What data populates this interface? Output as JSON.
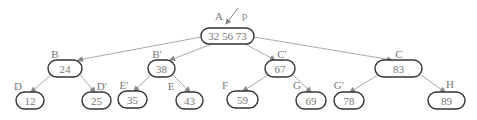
{
  "diagram": {
    "type": "tree",
    "pointer": {
      "label": "p"
    },
    "nodes": [
      {
        "id": "A",
        "label": "A",
        "keys": "32  56  73",
        "x": 201,
        "y": 28,
        "w": 53,
        "h": 16,
        "lx": 219,
        "ly": 20
      },
      {
        "id": "B",
        "label": "B",
        "keys": "24",
        "x": 48,
        "y": 60,
        "w": 34,
        "h": 17,
        "lx": 55,
        "ly": 58
      },
      {
        "id": "B1",
        "label": "B′",
        "keys": "38",
        "x": 148,
        "y": 60,
        "w": 27,
        "h": 17,
        "lx": 157,
        "ly": 58
      },
      {
        "id": "C1",
        "label": "C′",
        "keys": "67",
        "x": 265,
        "y": 60,
        "w": 30,
        "h": 17,
        "lx": 282,
        "ly": 58
      },
      {
        "id": "C",
        "label": "C",
        "keys": "83",
        "x": 375,
        "y": 60,
        "w": 47,
        "h": 17,
        "lx": 399,
        "ly": 58
      },
      {
        "id": "D",
        "label": "D",
        "keys": "12",
        "x": 16,
        "y": 92,
        "w": 28,
        "h": 17,
        "lx": 18,
        "ly": 90
      },
      {
        "id": "D1",
        "label": "D′",
        "keys": "25",
        "x": 82,
        "y": 92,
        "w": 29,
        "h": 17,
        "lx": 102,
        "ly": 90
      },
      {
        "id": "E1",
        "label": "E′",
        "keys": "35",
        "x": 118,
        "y": 91,
        "w": 29,
        "h": 17,
        "lx": 124,
        "ly": 89
      },
      {
        "id": "E",
        "label": "E",
        "keys": "43",
        "x": 176,
        "y": 92,
        "w": 27,
        "h": 17,
        "lx": 171,
        "ly": 90
      },
      {
        "id": "F",
        "label": "F",
        "keys": "59",
        "x": 227,
        "y": 91,
        "w": 31,
        "h": 17,
        "lx": 225,
        "ly": 89
      },
      {
        "id": "G",
        "label": "G",
        "keys": "69",
        "x": 296,
        "y": 92,
        "w": 30,
        "h": 17,
        "lx": 297,
        "ly": 89
      },
      {
        "id": "G1",
        "label": "G′",
        "keys": "78",
        "x": 334,
        "y": 92,
        "w": 30,
        "h": 17,
        "lx": 339,
        "ly": 89
      },
      {
        "id": "H",
        "label": "H",
        "keys": "89",
        "x": 428,
        "y": 92,
        "w": 37,
        "h": 17,
        "lx": 450,
        "ly": 88
      }
    ],
    "edges": [
      {
        "from": "A",
        "to": "B",
        "x1": 201,
        "y1": 37,
        "x2": 78,
        "y2": 60
      },
      {
        "from": "A",
        "to": "B1",
        "x1": 212,
        "y1": 44,
        "x2": 170,
        "y2": 60
      },
      {
        "from": "A",
        "to": "C1",
        "x1": 245,
        "y1": 44,
        "x2": 275,
        "y2": 60
      },
      {
        "from": "A",
        "to": "C",
        "x1": 254,
        "y1": 37,
        "x2": 392,
        "y2": 60
      },
      {
        "from": "B",
        "to": "D",
        "x1": 51,
        "y1": 75,
        "x2": 31,
        "y2": 92
      },
      {
        "from": "B",
        "to": "D1",
        "x1": 80,
        "y1": 75,
        "x2": 95,
        "y2": 92
      },
      {
        "from": "B1",
        "to": "E1",
        "x1": 151,
        "y1": 75,
        "x2": 134,
        "y2": 91
      },
      {
        "from": "B1",
        "to": "E",
        "x1": 173,
        "y1": 75,
        "x2": 190,
        "y2": 92
      },
      {
        "from": "C1",
        "to": "F",
        "x1": 268,
        "y1": 75,
        "x2": 243,
        "y2": 91
      },
      {
        "from": "C1",
        "to": "G",
        "x1": 293,
        "y1": 75,
        "x2": 311,
        "y2": 92
      },
      {
        "from": "C",
        "to": "G1",
        "x1": 378,
        "y1": 75,
        "x2": 350,
        "y2": 92
      },
      {
        "from": "C",
        "to": "H",
        "x1": 421,
        "y1": 75,
        "x2": 445,
        "y2": 92
      }
    ]
  }
}
